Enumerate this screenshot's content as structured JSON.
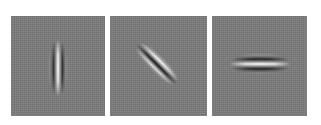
{
  "figure": {
    "background_color": "#ffffff",
    "panel_background_color": "#7b7b7b",
    "panels": [
      {
        "name": "gabor-filter-vertical",
        "orientation": "vertical",
        "angle_deg": 90,
        "position": {
          "x": 11,
          "y": 16,
          "width": 94,
          "height": 100
        }
      },
      {
        "name": "gabor-filter-diagonal",
        "orientation": "diagonal",
        "angle_deg": -45,
        "position": {
          "x": 110,
          "y": 16,
          "width": 97,
          "height": 100
        }
      },
      {
        "name": "gabor-filter-horizontal",
        "orientation": "horizontal",
        "angle_deg": 0,
        "position": {
          "x": 212,
          "y": 16,
          "width": 95,
          "height": 100
        }
      }
    ]
  }
}
